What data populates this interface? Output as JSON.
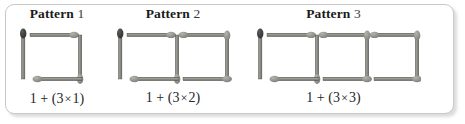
{
  "figure": {
    "background_color": "#ffffff",
    "border_color": "#c9c9c9",
    "stick_body_color": "#8a8a86",
    "stick_edge_color": "#55554f",
    "stick_head_color": "#9a9a95",
    "stick_head_dark_color": "#3f3f3f"
  },
  "patterns": [
    {
      "title_word": "Pattern",
      "title_number": "1",
      "equation": {
        "lead": "1 + (3",
        "times": "×",
        "multiplier": "1",
        "close": ")",
        "full": "1 + (3 × 1)"
      },
      "squares": 1,
      "matchstick_count": 4
    },
    {
      "title_word": "Pattern",
      "title_number": "2",
      "equation": {
        "lead": "1 + (3",
        "times": "×",
        "multiplier": "2",
        "close": ")",
        "full": "1 + (3 × 2)"
      },
      "squares": 2,
      "matchstick_count": 7
    },
    {
      "title_word": "Pattern",
      "title_number": "3",
      "equation": {
        "lead": "1 + (3",
        "times": "×",
        "multiplier": "3",
        "close": ")",
        "full": "1 + (3 × 3)"
      },
      "squares": 3,
      "matchstick_count": 10
    }
  ]
}
